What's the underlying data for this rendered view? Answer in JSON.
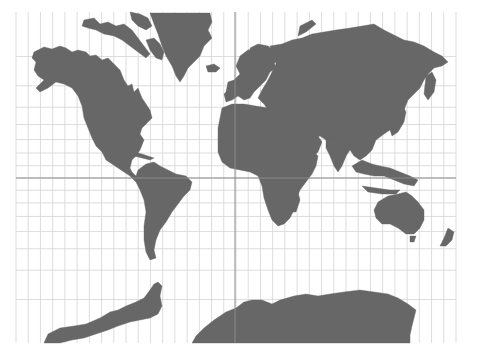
{
  "map": {
    "title": "World Map (Mercator projection)",
    "projection": "Mercator",
    "colors": {
      "background": "#ffffff",
      "land": "#676767",
      "graticule": "#d4d4d4",
      "equator_and_prime_meridian": "#8a8a8a"
    },
    "frame": {
      "x0": 16,
      "y0": 12,
      "x1": 456,
      "y1": 343
    },
    "graticule": {
      "meridian_spacing_deg": 10,
      "parallel_spacing_deg": 10,
      "equator_y": 178,
      "prime_meridian_x": 235
    },
    "landmasses": [
      {
        "name": "North America",
        "points": "34,52 44,47 52,49 60,46 66,48 72,52 78,50 86,52 90,56 96,55 102,60 108,58 114,64 120,70 124,80 128,86 132,84 134,92 138,88 142,98 146,104 150,110 152,118 148,122 142,128 140,134 144,140 140,150 136,156 132,160 130,168 132,172 136,176 140,180 136,182 130,176 124,172 118,168 112,164 106,160 102,152 96,146 92,138 88,128 84,118 82,106 78,96 72,88 64,84 56,82 48,88 40,92 36,88 44,80 38,76 34,70 36,62 32,58"
      },
      {
        "name": "Central America / Caribbean",
        "points": "126,150 134,152 142,154 148,156 154,158 150,160 142,158 134,156 128,154"
      },
      {
        "name": "Arctic Archipelago",
        "points": "84,20 94,18 100,24 108,22 116,26 124,24 132,30 138,38 144,46 150,54 146,58 138,52 130,46 122,40 114,36 104,34 96,30 88,28 82,26"
      },
      {
        "name": "Arctic islands 2",
        "points": "130,12 140,14 148,18 152,26 146,30 138,26 132,20"
      },
      {
        "name": "Baffin Island",
        "points": "146,40 154,38 160,44 164,52 162,60 156,58 150,50"
      },
      {
        "name": "Greenland",
        "points": "150,13 172,13 196,13 210,13 212,22 208,30 212,38 204,46 200,56 194,62 188,68 184,76 180,82 176,76 172,66 166,56 162,46 158,34 154,24"
      },
      {
        "name": "Iceland",
        "points": "206,66 214,64 220,68 216,72 208,72"
      },
      {
        "name": "South America",
        "points": "138,170 146,164 154,162 160,166 168,170 176,174 186,176 192,182 190,190 184,196 178,204 172,212 166,222 160,230 156,240 154,250 156,258 150,260 146,252 144,240 144,226 146,212 144,200 140,190 136,182 136,176"
      },
      {
        "name": "Europe",
        "points": "240,56 248,50 256,48 262,52 268,58 274,62 276,68 270,72 266,80 260,86 254,92 250,98 244,100 238,96 232,100 226,102 224,94 230,88 234,80 240,74 236,66"
      },
      {
        "name": "Scandinavia",
        "points": "250,48 258,44 268,46 276,52 280,60 272,64 266,58 258,54 252,54"
      },
      {
        "name": "British Isles",
        "points": "228,82 234,80 236,88 232,94 226,92"
      },
      {
        "name": "Asia",
        "points": "270,46 282,44 292,40 302,38 312,34 324,32 336,30 350,28 362,26 374,24 384,30 396,36 404,40 414,42 424,46 434,52 442,56 448,62 442,66 434,68 428,74 424,80 420,88 414,94 408,100 404,110 402,118 398,124 390,130 384,134 376,140 372,150 366,156 360,160 354,156 350,150 346,156 342,164 336,162 332,154 330,146 326,140 320,136 312,140 306,144 300,150 294,146 290,140 284,134 280,128 276,122 272,116 268,110 264,104 258,98 262,90 268,80 272,72 276,64 274,56"
      },
      {
        "name": "Arabian Peninsula",
        "points": "300,132 310,132 318,136 322,142 318,152 312,158 306,158 300,150 296,142"
      },
      {
        "name": "India",
        "points": "326,138 336,138 344,146 346,156 342,166 338,172 334,166 330,156 326,148"
      },
      {
        "name": "Kamchatka",
        "points": "426,76 432,72 436,80 434,92 428,100 424,94"
      },
      {
        "name": "Japan",
        "points": "396,108 402,104 406,112 404,122 398,132 392,136 390,130 394,122"
      },
      {
        "name": "Novaya Zemlya",
        "points": "300,26 312,20 316,24 306,32 298,36"
      },
      {
        "name": "Africa",
        "points": "222,108 232,104 244,104 256,106 268,108 278,110 286,112 292,120 298,130 304,140 310,148 318,156 316,166 312,174 306,182 300,190 296,200 294,210 290,218 284,224 278,226 272,220 268,210 264,198 262,186 258,176 250,172 240,170 230,168 222,162 218,152 218,140 218,128 220,118"
      },
      {
        "name": "Madagascar",
        "points": "292,196 298,192 300,200 296,212 290,212"
      },
      {
        "name": "Southeast Asia islands",
        "points": "352,166 362,160 372,164 380,166 390,168 400,172 410,176 418,180 414,186 404,184 394,180 384,176 374,176 364,174 356,172"
      },
      {
        "name": "Indonesia south",
        "points": "362,186 376,188 390,190 400,190 396,194 382,194 368,192"
      },
      {
        "name": "Australia",
        "points": "378,202 388,196 398,194 406,192 412,196 418,202 424,210 424,220 420,228 414,234 406,234 398,228 390,224 382,224 376,218 374,210"
      },
      {
        "name": "Tasmania",
        "points": "410,236 416,236 414,242 410,242"
      },
      {
        "name": "New Zealand",
        "points": "448,228 454,232 452,240 446,246 440,246 444,238"
      },
      {
        "name": "Antarctic Peninsula",
        "points": "44,343 48,334 60,328 74,326 86,324 100,318 110,312 118,310 126,306 136,302 144,298 150,290 154,284 158,282 162,286 160,296 162,306 158,314 150,318 140,320 130,322 118,326 108,330 96,334 84,338 72,340 60,343"
      },
      {
        "name": "Antarctica East",
        "points": "192,343 196,336 204,328 214,320 226,312 236,308 244,302 252,300 262,300 272,304 280,300 294,296 306,294 318,296 330,294 344,292 360,290 374,292 388,294 398,298 408,304 416,310 414,318 412,326 410,335 410,343"
      }
    ]
  }
}
